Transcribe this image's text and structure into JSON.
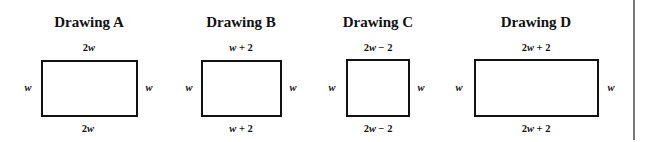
{
  "drawings": [
    {
      "title": "Drawing A",
      "top": "2w",
      "bottom": "2w",
      "left": "w",
      "right": "w",
      "rect": {
        "x": 41,
        "y": 60,
        "w": 97,
        "h": 57
      }
    },
    {
      "title": "Drawing B",
      "top": "w + 2",
      "bottom": "w + 2",
      "left": "w",
      "right": "w",
      "rect": {
        "x": 201,
        "y": 60,
        "w": 81,
        "h": 57
      }
    },
    {
      "title": "Drawing C",
      "top": "2w − 2",
      "bottom": "2w − 2",
      "left": "w",
      "right": "w",
      "rect": {
        "x": 346,
        "y": 59,
        "w": 64,
        "h": 58
      }
    },
    {
      "title": "Drawing D",
      "top": "2w + 2",
      "bottom": "2w + 2",
      "left": "w",
      "right": "w",
      "rect": {
        "x": 474,
        "y": 59,
        "w": 125,
        "h": 58
      }
    }
  ]
}
